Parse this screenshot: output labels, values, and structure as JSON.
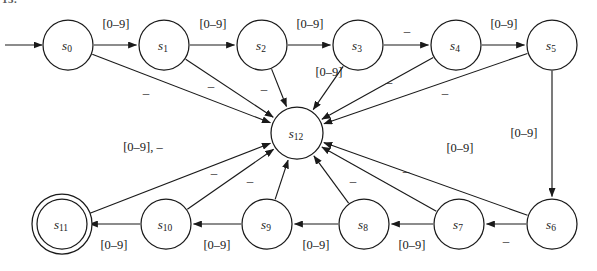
{
  "figure": {
    "caption_fragment": "13.",
    "alphabet_digit": "[0–9]",
    "alphabet_dash": "–",
    "combined_label": "[0–9], –"
  },
  "diagram": {
    "type": "state-machine",
    "start_state": "s0",
    "accepting_states": [
      "s11"
    ],
    "error_state": "s12",
    "nodes": [
      {
        "id": "s0",
        "label": "s",
        "sub": "0",
        "cx": 68,
        "cy": 45,
        "r": 25,
        "accepting": false
      },
      {
        "id": "s1",
        "label": "s",
        "sub": "1",
        "cx": 164,
        "cy": 45,
        "r": 25,
        "accepting": false
      },
      {
        "id": "s2",
        "label": "s",
        "sub": "2",
        "cx": 262,
        "cy": 45,
        "r": 25,
        "accepting": false
      },
      {
        "id": "s3",
        "label": "s",
        "sub": "3",
        "cx": 358,
        "cy": 45,
        "r": 25,
        "accepting": false
      },
      {
        "id": "s4",
        "label": "s",
        "sub": "4",
        "cx": 456,
        "cy": 45,
        "r": 25,
        "accepting": false
      },
      {
        "id": "s5",
        "label": "s",
        "sub": "5",
        "cx": 552,
        "cy": 45,
        "r": 25,
        "accepting": false
      },
      {
        "id": "s6",
        "label": "s",
        "sub": "6",
        "cx": 552,
        "cy": 224,
        "r": 25,
        "accepting": false
      },
      {
        "id": "s7",
        "label": "s",
        "sub": "7",
        "cx": 459,
        "cy": 224,
        "r": 25,
        "accepting": false
      },
      {
        "id": "s8",
        "label": "s",
        "sub": "8",
        "cx": 364,
        "cy": 224,
        "r": 25,
        "accepting": false
      },
      {
        "id": "s9",
        "label": "s",
        "sub": "9",
        "cx": 267,
        "cy": 224,
        "r": 25,
        "accepting": false
      },
      {
        "id": "s10",
        "label": "s",
        "sub": "10",
        "cx": 166,
        "cy": 224,
        "r": 25,
        "accepting": false
      },
      {
        "id": "s11",
        "label": "s",
        "sub": "11",
        "cx": 62,
        "cy": 224,
        "r": 25,
        "accepting": true
      },
      {
        "id": "s12",
        "label": "s",
        "sub": "12",
        "cx": 297,
        "cy": 133,
        "r": 26,
        "accepting": false
      }
    ],
    "transitions": [
      {
        "from": "start",
        "to": "s0",
        "label": "",
        "label_x": 0,
        "label_y": 0
      },
      {
        "from": "s0",
        "to": "s1",
        "label": "[0–9]",
        "label_x": 116,
        "label_y": 24
      },
      {
        "from": "s1",
        "to": "s2",
        "label": "[0–9]",
        "label_x": 213,
        "label_y": 24
      },
      {
        "from": "s2",
        "to": "s3",
        "label": "[0–9]",
        "label_x": 310,
        "label_y": 24
      },
      {
        "from": "s3",
        "to": "s4",
        "label": "–",
        "label_x": 407,
        "label_y": 30
      },
      {
        "from": "s4",
        "to": "s5",
        "label": "[0–9]",
        "label_x": 504,
        "label_y": 24
      },
      {
        "from": "s5",
        "to": "s6",
        "label": "[0–9]",
        "label_x": 524,
        "label_y": 133
      },
      {
        "from": "s6",
        "to": "s7",
        "label": "–",
        "label_x": 506,
        "label_y": 240
      },
      {
        "from": "s7",
        "to": "s8",
        "label": "[0–9]",
        "label_x": 412,
        "label_y": 245
      },
      {
        "from": "s8",
        "to": "s9",
        "label": "[0–9]",
        "label_x": 316,
        "label_y": 245
      },
      {
        "from": "s9",
        "to": "s10",
        "label": "[0–9]",
        "label_x": 217,
        "label_y": 245
      },
      {
        "from": "s10",
        "to": "s11",
        "label": "[0–9]",
        "label_x": 114,
        "label_y": 245
      },
      {
        "from": "s0",
        "to": "s12",
        "label": "–",
        "label_x": 146,
        "label_y": 92
      },
      {
        "from": "s1",
        "to": "s12",
        "label": "–",
        "label_x": 211,
        "label_y": 85
      },
      {
        "from": "s2",
        "to": "s12",
        "label": "–",
        "label_x": 264,
        "label_y": 88
      },
      {
        "from": "s3",
        "to": "s12",
        "label": "[0–9]",
        "label_x": 329,
        "label_y": 72
      },
      {
        "from": "s4",
        "to": "s12",
        "label": "–",
        "label_x": 389,
        "label_y": 81
      },
      {
        "from": "s5",
        "to": "s12",
        "label": "–",
        "label_x": 445,
        "label_y": 92
      },
      {
        "from": "s6",
        "to": "s12",
        "label": "[0–9]",
        "label_x": 460,
        "label_y": 148
      },
      {
        "from": "s7",
        "to": "s12",
        "label": "–",
        "label_x": 406,
        "label_y": 170
      },
      {
        "from": "s8",
        "to": "s12",
        "label": "–",
        "label_x": 353,
        "label_y": 180
      },
      {
        "from": "s9",
        "to": "s12",
        "label": "–",
        "label_x": 250,
        "label_y": 180
      },
      {
        "from": "s10",
        "to": "s12",
        "label": "–",
        "label_x": 214,
        "label_y": 172
      },
      {
        "from": "s11",
        "to": "s12",
        "label": "[0–9], –",
        "label_x": 143,
        "label_y": 147
      }
    ]
  }
}
